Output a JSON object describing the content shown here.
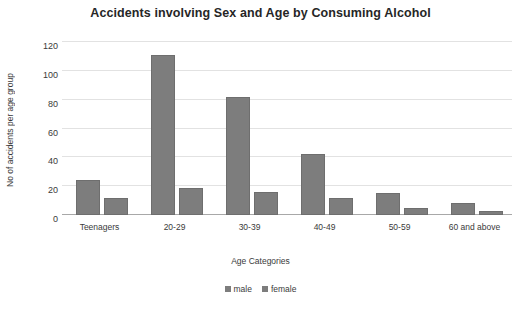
{
  "chart_data": {
    "type": "bar",
    "title": "Accidents involving Sex and Age by Consuming Alcohol",
    "xlabel": "Age Categories",
    "ylabel": "No of accidents per age group",
    "categories": [
      "Teenagers",
      "20-29",
      "30-39",
      "40-49",
      "50-59",
      "60 and above"
    ],
    "series": [
      {
        "name": "male",
        "values": [
          24,
          111,
          82,
          42,
          15,
          8
        ]
      },
      {
        "name": "female",
        "values": [
          12,
          19,
          16,
          12,
          5,
          3
        ]
      }
    ],
    "ylim": [
      0,
      120
    ],
    "yticks": [
      0,
      20,
      40,
      60,
      80,
      100,
      120
    ],
    "ytick_labels": [
      "0",
      "20",
      "40",
      "60",
      "80",
      "100",
      "120"
    ],
    "grid": true,
    "legend_position": "bottom",
    "series_colors": [
      "#7d7d7d",
      "#7d7d7d"
    ],
    "bar_color": "#7d7d7d"
  },
  "legend": {
    "items": [
      {
        "label": "male"
      },
      {
        "label": "female"
      }
    ]
  }
}
